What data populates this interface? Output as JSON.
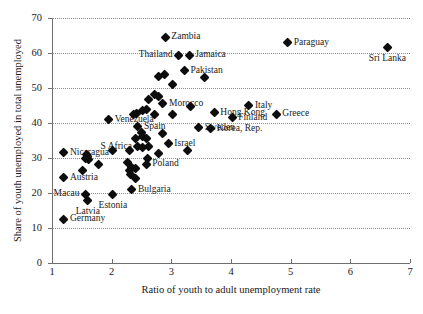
{
  "chart_data": {
    "type": "scatter",
    "title": "",
    "xlabel": "Ratio of youth to adult unemployment rate",
    "ylabel": "Share of youth unemployed in total unemployed",
    "xlim": [
      1,
      7
    ],
    "ylim": [
      0,
      70
    ],
    "xticks": [
      1,
      2,
      3,
      4,
      5,
      6,
      7
    ],
    "yticks": [
      0,
      10,
      20,
      30,
      40,
      50,
      60,
      70
    ],
    "grid": "horizontal-dotted",
    "legend": "none",
    "marker": "filled-diamond",
    "marker_color": "#0d0d0d",
    "points": [
      {
        "label": "Zambia",
        "x": 2.9,
        "y": 64.5,
        "pos": "right"
      },
      {
        "label": "Paraguay",
        "x": 4.95,
        "y": 63.0,
        "pos": "right"
      },
      {
        "label": "Sri Lanka",
        "x": 6.62,
        "y": 61.5,
        "pos": "below"
      },
      {
        "label": "Thailand",
        "x": 3.12,
        "y": 59.3,
        "pos": "left"
      },
      {
        "label": "Jamaica",
        "x": 3.3,
        "y": 59.3,
        "pos": "right"
      },
      {
        "label": "Pakistan",
        "x": 3.22,
        "y": 55.0,
        "pos": "right"
      },
      {
        "label": "",
        "x": 3.55,
        "y": 53.0,
        "pos": "right"
      },
      {
        "label": "",
        "x": 2.78,
        "y": 53.2,
        "pos": "right"
      },
      {
        "label": "",
        "x": 2.88,
        "y": 53.8,
        "pos": "right"
      },
      {
        "label": "",
        "x": 3.02,
        "y": 51.0,
        "pos": "right"
      },
      {
        "label": "",
        "x": 2.72,
        "y": 48.0,
        "pos": "right"
      },
      {
        "label": "",
        "x": 2.78,
        "y": 47.5,
        "pos": "right"
      },
      {
        "label": "",
        "x": 2.62,
        "y": 46.8,
        "pos": "right"
      },
      {
        "label": "Morocco",
        "x": 2.86,
        "y": 45.5,
        "pos": "right"
      },
      {
        "label": "",
        "x": 3.32,
        "y": 44.7,
        "pos": "right"
      },
      {
        "label": "Italy",
        "x": 4.3,
        "y": 45.0,
        "pos": "right"
      },
      {
        "label": "Hong Kong",
        "x": 3.72,
        "y": 43.0,
        "pos": "right"
      },
      {
        "label": "Greece",
        "x": 4.76,
        "y": 42.5,
        "pos": "right"
      },
      {
        "label": "Finland",
        "x": 4.02,
        "y": 41.5,
        "pos": "right"
      },
      {
        "label": "",
        "x": 2.52,
        "y": 43.6,
        "pos": "right"
      },
      {
        "label": "",
        "x": 2.58,
        "y": 43.7,
        "pos": "right"
      },
      {
        "label": "",
        "x": 2.42,
        "y": 42.8,
        "pos": "right"
      },
      {
        "label": "",
        "x": 2.36,
        "y": 42.4,
        "pos": "right"
      },
      {
        "label": "",
        "x": 2.72,
        "y": 42.3,
        "pos": "right"
      },
      {
        "label": "",
        "x": 3.02,
        "y": 42.3,
        "pos": "right"
      },
      {
        "label": "Venezuela",
        "x": 1.95,
        "y": 40.9,
        "pos": "right"
      },
      {
        "label": "Spain",
        "x": 2.44,
        "y": 39.0,
        "pos": "right"
      },
      {
        "label": "Sweden",
        "x": 3.46,
        "y": 38.6,
        "pos": "right"
      },
      {
        "label": "Korea, Rep.",
        "x": 3.66,
        "y": 38.4,
        "pos": "right"
      },
      {
        "label": "",
        "x": 2.5,
        "y": 37.3,
        "pos": "right"
      },
      {
        "label": "",
        "x": 2.52,
        "y": 36.2,
        "pos": "right"
      },
      {
        "label": "",
        "x": 2.86,
        "y": 37.0,
        "pos": "right"
      },
      {
        "label": "",
        "x": 2.4,
        "y": 35.5,
        "pos": "right"
      },
      {
        "label": "",
        "x": 2.58,
        "y": 35.6,
        "pos": "right"
      },
      {
        "label": "Israel",
        "x": 2.95,
        "y": 34.0,
        "pos": "right"
      },
      {
        "label": "",
        "x": 2.62,
        "y": 33.4,
        "pos": "right"
      },
      {
        "label": "",
        "x": 2.52,
        "y": 33.0,
        "pos": "right"
      },
      {
        "label": "S Africa",
        "x": 2.44,
        "y": 33.2,
        "pos": "left"
      },
      {
        "label": "",
        "x": 2.3,
        "y": 32.2,
        "pos": "right"
      },
      {
        "label": "",
        "x": 2.02,
        "y": 32.2,
        "pos": "right"
      },
      {
        "label": "",
        "x": 3.28,
        "y": 32.0,
        "pos": "right"
      },
      {
        "label": "",
        "x": 2.78,
        "y": 31.2,
        "pos": "right"
      },
      {
        "label": "Nicaragua",
        "x": 1.2,
        "y": 31.5,
        "pos": "right"
      },
      {
        "label": "",
        "x": 1.58,
        "y": 31.0,
        "pos": "right"
      },
      {
        "label": "",
        "x": 1.6,
        "y": 30.3,
        "pos": "right"
      },
      {
        "label": "",
        "x": 1.62,
        "y": 29.6,
        "pos": "right"
      },
      {
        "label": "",
        "x": 1.56,
        "y": 29.8,
        "pos": "right"
      },
      {
        "label": "",
        "x": 2.6,
        "y": 29.7,
        "pos": "right"
      },
      {
        "label": "",
        "x": 2.26,
        "y": 28.6,
        "pos": "right"
      },
      {
        "label": "Poland",
        "x": 2.58,
        "y": 28.2,
        "pos": "right"
      },
      {
        "label": "",
        "x": 1.78,
        "y": 28.0,
        "pos": "right"
      },
      {
        "label": "",
        "x": 2.34,
        "y": 27.2,
        "pos": "right"
      },
      {
        "label": "",
        "x": 2.4,
        "y": 27.0,
        "pos": "right"
      },
      {
        "label": "",
        "x": 2.3,
        "y": 26.3,
        "pos": "right"
      },
      {
        "label": "",
        "x": 1.52,
        "y": 26.5,
        "pos": "right"
      },
      {
        "label": "",
        "x": 2.32,
        "y": 25.4,
        "pos": "right"
      },
      {
        "label": "",
        "x": 2.4,
        "y": 24.2,
        "pos": "right"
      },
      {
        "label": "Austria",
        "x": 1.2,
        "y": 24.4,
        "pos": "right"
      },
      {
        "label": "Bulgaria",
        "x": 2.34,
        "y": 21.0,
        "pos": "right"
      },
      {
        "label": "Estonia",
        "x": 2.02,
        "y": 19.5,
        "pos": "below"
      },
      {
        "label": "Macau",
        "x": 1.56,
        "y": 19.6,
        "pos": "left"
      },
      {
        "label": "Latvia",
        "x": 1.6,
        "y": 17.8,
        "pos": "below"
      },
      {
        "label": "Germany",
        "x": 1.2,
        "y": 12.5,
        "pos": "right"
      }
    ]
  }
}
